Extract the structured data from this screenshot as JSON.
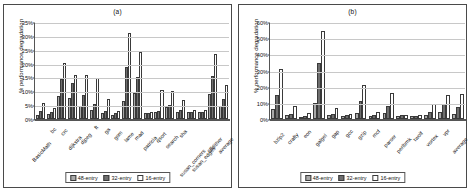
{
  "figure": {
    "legend_labels": [
      "48-entry",
      "32-entry",
      "16-entry"
    ],
    "series_colors": [
      "#a9a9a9",
      "#6e6e6e",
      "#ffffff"
    ]
  },
  "panel_a": {
    "title": "(a)",
    "ylabel": "% performance degradation"
  },
  "panel_b": {
    "title": "(b)",
    "ylabel": "% performance degradation"
  },
  "chart_data": [
    {
      "type": "bar",
      "title": "(a)",
      "xlabel": "",
      "ylabel": "% performance degradation",
      "ylim": [
        0,
        35
      ],
      "yticks": [
        "0%",
        "5%",
        "10%",
        "15%",
        "20%",
        "25%",
        "30%",
        "35%"
      ],
      "ytick_values": [
        0,
        5,
        10,
        15,
        20,
        25,
        30,
        35
      ],
      "grid": true,
      "legend_position": "bottom",
      "categories": [
        "BasicMath",
        "bc",
        "crc",
        "dijkstra",
        "djpeg",
        "ft",
        "ga",
        "gsm",
        "lame",
        "mad",
        "patricia",
        "qsort",
        "search",
        "sha",
        "susan_corners",
        "susan_edges",
        "tiffdither",
        "average"
      ],
      "series": [
        {
          "name": "48-entry",
          "values": [
            1.6,
            1.8,
            8.2,
            7.5,
            4.7,
            3.4,
            2.3,
            1.6,
            6.4,
            9.5,
            2.2,
            2.4,
            4.2,
            2.5,
            2.4,
            2.4,
            9.0,
            4.6
          ]
        },
        {
          "name": "32-entry",
          "values": [
            2.9,
            2.4,
            14.4,
            13.0,
            8.8,
            5.4,
            2.8,
            2.2,
            18.6,
            15.3,
            2.3,
            3.0,
            4.9,
            3.1,
            2.7,
            2.6,
            15.4,
            7.4
          ]
        },
        {
          "name": "16-entry",
          "values": [
            5.9,
            3.8,
            20.1,
            15.9,
            15.9,
            14.7,
            7.1,
            3.0,
            31.2,
            24.2,
            2.4,
            10.5,
            10.1,
            6.7,
            3.2,
            3.4,
            23.5,
            12.1
          ]
        }
      ]
    },
    {
      "type": "bar",
      "title": "(b)",
      "xlabel": "",
      "ylabel": "% performance degradation",
      "ylim": [
        0,
        60
      ],
      "yticks": [
        "0%",
        "10%",
        "20%",
        "30%",
        "40%",
        "50%",
        "60%"
      ],
      "ytick_values": [
        0,
        10,
        20,
        30,
        40,
        50,
        60
      ],
      "grid": true,
      "legend_position": "bottom",
      "categories": [
        "bzip2",
        "crafty",
        "eon",
        "galgel",
        "gap",
        "gcc",
        "gzip",
        "mcf",
        "parser",
        "perlbmk",
        "twolf",
        "vortex",
        "vpr",
        "average"
      ],
      "series": [
        {
          "name": "48-entry",
          "values": [
            6.3,
            2.3,
            1.2,
            10.2,
            2.5,
            1.6,
            3.9,
            1.6,
            3.8,
            1.9,
            1.6,
            2.6,
            4.1,
            3.3
          ]
        },
        {
          "name": "32-entry",
          "values": [
            14.6,
            3.4,
            2.1,
            34.6,
            3.1,
            2.2,
            11.2,
            2.4,
            7.9,
            2.2,
            2.1,
            4.4,
            9.0,
            7.6
          ]
        },
        {
          "name": "16-entry",
          "values": [
            31.0,
            8.1,
            3.6,
            54.2,
            6.6,
            3.4,
            20.8,
            4.3,
            16.3,
            2.4,
            2.3,
            9.1,
            15.1,
            15.6
          ]
        }
      ]
    }
  ]
}
